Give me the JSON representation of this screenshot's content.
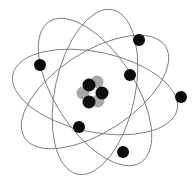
{
  "diagram": {
    "title": "",
    "center": [
      95,
      92
    ],
    "orbit_color": "#7a7a7a",
    "electron_color": "#0a0a0a",
    "proton_color": "#0f0f0f",
    "neutron_color": "#a8a8a8",
    "orbits": [
      {
        "rx": 84,
        "ry": 40,
        "rotate": 12
      },
      {
        "rx": 84,
        "ry": 40,
        "rotate": 57
      },
      {
        "rx": 84,
        "ry": 40,
        "rotate": 102
      },
      {
        "rx": 84,
        "ry": 40,
        "rotate": 147
      }
    ],
    "electrons": [
      {
        "x": 40,
        "y": 65
      },
      {
        "x": 139,
        "y": 40
      },
      {
        "x": 130,
        "y": 75
      },
      {
        "x": 181,
        "y": 97
      },
      {
        "x": 79,
        "y": 127
      },
      {
        "x": 123,
        "y": 152
      }
    ],
    "nucleus": [
      {
        "type": "neutron",
        "x": 97,
        "y": 82
      },
      {
        "type": "neutron",
        "x": 83,
        "y": 93
      },
      {
        "type": "neutron",
        "x": 98,
        "y": 101
      },
      {
        "type": "proton",
        "x": 89,
        "y": 85
      },
      {
        "type": "proton",
        "x": 102,
        "y": 93
      },
      {
        "type": "proton",
        "x": 89,
        "y": 102
      }
    ]
  }
}
